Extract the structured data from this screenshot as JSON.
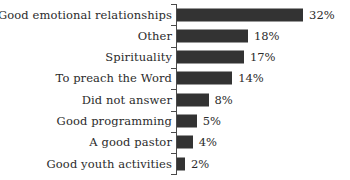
{
  "chart_data": {
    "type": "bar",
    "orientation": "horizontal",
    "title": "",
    "subtitle": "",
    "xlabel": "",
    "ylabel": "",
    "xlim": [
      0,
      32
    ],
    "grid": false,
    "legend": null,
    "value_suffix": "%",
    "bar_color": "#333333",
    "axis_color": "#4a4a4a",
    "background": "#ffffff",
    "categories": [
      "Good emotional relationships",
      "Other",
      "Spirituality",
      "To preach the Word",
      "Did not answer",
      "Good programming",
      "A good pastor",
      "Good youth activities"
    ],
    "values": [
      32,
      18,
      17,
      14,
      8,
      5,
      4,
      2
    ],
    "value_labels": [
      "32%",
      "18%",
      "17%",
      "14%",
      "8%",
      "5%",
      "4%",
      "2%"
    ],
    "series": [
      {
        "name": "",
        "values": [
          32,
          18,
          17,
          14,
          8,
          5,
          4,
          2
        ]
      }
    ]
  }
}
